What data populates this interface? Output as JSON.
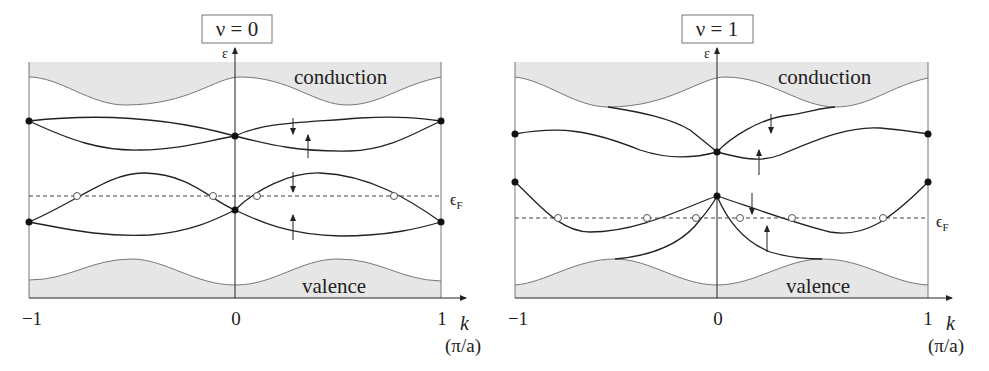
{
  "panels": [
    {
      "title": "ν = 0",
      "y_axis_label": "ε",
      "x_axis_label": "k",
      "x_unit": "(π/a)",
      "x_ticks": [
        "−1",
        "0",
        "1"
      ],
      "band_labels": {
        "top": "conduction",
        "bottom": "valence"
      },
      "fermi_label": "εF",
      "spin_down": "↓",
      "spin_up": "↑"
    },
    {
      "title": "ν = 1",
      "y_axis_label": "ε",
      "x_axis_label": "k",
      "x_unit": "(π/a)",
      "x_ticks": [
        "−1",
        "0",
        "1"
      ],
      "band_labels": {
        "top": "conduction",
        "bottom": "valence"
      },
      "fermi_label": "εF",
      "spin_down": "↓",
      "spin_up": "↑"
    }
  ],
  "colors": {
    "band_fill": "#e6e6e6",
    "line": "#222222",
    "edge": "#777777"
  }
}
